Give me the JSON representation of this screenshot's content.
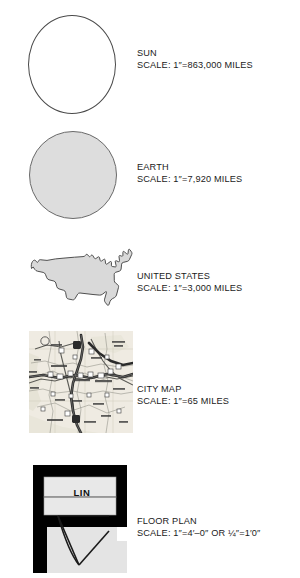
{
  "figure": {
    "kind": "scale-comparison-chart",
    "background_color": "#ffffff"
  },
  "rows": [
    {
      "id": "sun",
      "title": "SUN",
      "scale": "SCALE: 1″=863,000 MILES",
      "graphic": "white-circle",
      "fill_color": "#ffffff",
      "stroke_color": "#4a4a4a"
    },
    {
      "id": "earth",
      "title": "EARTH",
      "scale": "SCALE: 1″=7,920 MILES",
      "graphic": "gray-circle",
      "fill_color": "#dddddd",
      "stroke_color": "#6a6a6a"
    },
    {
      "id": "united-states",
      "title": "UNITED STATES",
      "scale": "SCALE: 1″=3,000 MILES",
      "graphic": "usa-silhouette",
      "fill_color": "#d9d9d9",
      "stroke_color": "#3d3d3d"
    },
    {
      "id": "city-map",
      "title": "CITY MAP",
      "scale": "SCALE: 1″=65 MILES",
      "graphic": "road-map-thumbnail",
      "fill_color": "#efece4",
      "stroke_color": "#555555"
    },
    {
      "id": "floor-plan",
      "title": "FLOOR PLAN",
      "scale": "SCALE: 1″=4′–0″ OR ¼″=1′0″",
      "graphic": "architectural-floor-plan",
      "room_label": "LIN",
      "fill_color": "#e2e2e2",
      "stroke_color": "#000000"
    }
  ]
}
